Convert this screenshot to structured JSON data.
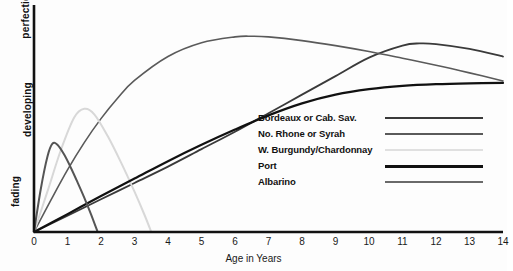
{
  "chart_data": {
    "type": "line",
    "title": "",
    "xlabel": "Age in Years",
    "ylabel": "",
    "xlim": [
      0,
      14
    ],
    "ylim": [
      0,
      1
    ],
    "grid": false,
    "legend_position": "center-right",
    "x_ticks": [
      "0",
      "1",
      "2",
      "3",
      "4",
      "5",
      "6",
      "7",
      "8",
      "9",
      "10",
      "11",
      "12",
      "13",
      "14"
    ],
    "y_category_labels": [
      "fading",
      "developing",
      "perfection"
    ],
    "series": [
      {
        "name": "Bordeaux or Cab. Sav.",
        "color": "#3a3a3a",
        "width": 1.8,
        "x": [
          0,
          1,
          2,
          3,
          4,
          5,
          6,
          7,
          8,
          9,
          10,
          11,
          11.5,
          12,
          13,
          14
        ],
        "values": [
          0.0,
          0.075,
          0.15,
          0.225,
          0.3,
          0.38,
          0.46,
          0.545,
          0.63,
          0.715,
          0.8,
          0.855,
          0.865,
          0.862,
          0.84,
          0.805
        ]
      },
      {
        "name": "No. Rhone or Syrah",
        "color": "#5a5a5a",
        "width": 1.6,
        "x": [
          0,
          0.5,
          1,
          1.5,
          2,
          2.5,
          3,
          4,
          5,
          6,
          6.5,
          7,
          8,
          9,
          10,
          11,
          12,
          13,
          14
        ],
        "values": [
          0.0,
          0.145,
          0.285,
          0.41,
          0.52,
          0.615,
          0.695,
          0.805,
          0.868,
          0.895,
          0.898,
          0.895,
          0.878,
          0.855,
          0.828,
          0.797,
          0.765,
          0.73,
          0.693
        ]
      },
      {
        "name": "W. Burgundy/Chardonnay",
        "color": "#d8d8d8",
        "width": 2.0,
        "x": [
          0,
          0.4,
          0.8,
          1.2,
          1.5,
          1.8,
          2.2,
          2.6,
          3.0,
          3.3,
          3.5
        ],
        "values": [
          0.0,
          0.185,
          0.375,
          0.525,
          0.565,
          0.54,
          0.44,
          0.318,
          0.185,
          0.078,
          0.0
        ]
      },
      {
        "name": "Port",
        "color": "#111111",
        "width": 2.2,
        "x": [
          0,
          1,
          2,
          3,
          4,
          5,
          6,
          7,
          8,
          9,
          10,
          11,
          12,
          13,
          14
        ],
        "values": [
          0.0,
          0.082,
          0.165,
          0.245,
          0.325,
          0.4,
          0.47,
          0.535,
          0.59,
          0.63,
          0.655,
          0.67,
          0.678,
          0.682,
          0.684
        ]
      },
      {
        "name": "Albarino",
        "color": "#555555",
        "width": 2.0,
        "x": [
          0,
          0.2,
          0.4,
          0.55,
          0.7,
          0.9,
          1.1,
          1.3,
          1.5,
          1.7,
          1.9
        ],
        "values": [
          0.0,
          0.195,
          0.345,
          0.405,
          0.4,
          0.355,
          0.295,
          0.228,
          0.158,
          0.082,
          0.0
        ]
      }
    ]
  },
  "axes": {
    "x_title": "Age in Years",
    "y_labels": {
      "top": "perfection",
      "middle": "developing",
      "bottom": "fading"
    },
    "ticks": [
      "0",
      "1",
      "2",
      "3",
      "4",
      "5",
      "6",
      "7",
      "8",
      "9",
      "10",
      "11",
      "12",
      "13",
      "14"
    ]
  },
  "legend": {
    "items": [
      {
        "label": "Bordeaux or Cab. Sav.",
        "color": "#3a3a3a",
        "width": 2.4
      },
      {
        "label": "No. Rhone or Syrah",
        "color": "#5a5a5a",
        "width": 2.0
      },
      {
        "label": "W. Burgundy/Chardonnay",
        "color": "#e0e0e0",
        "width": 2.4
      },
      {
        "label": "Port",
        "color": "#111111",
        "width": 3.0
      },
      {
        "label": "Albarino",
        "color": "#6a6a6a",
        "width": 2.4
      }
    ]
  },
  "colors": {
    "background": "#fdfdfd",
    "axis": "#111111",
    "text": "#1a1a1a"
  }
}
